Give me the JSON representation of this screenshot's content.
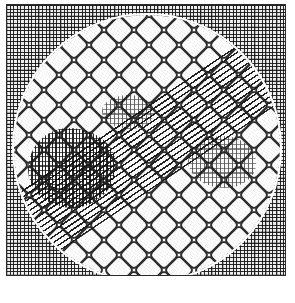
{
  "figure": {
    "kind": "raster-pattern-figure",
    "canvas": {
      "width": 295,
      "height": 303,
      "background": "#ffffff"
    },
    "margins": {
      "top": 4,
      "right": 9,
      "bottom": 27,
      "left": 6
    },
    "frame": {
      "name": "outer plate frame",
      "x": 6,
      "y": 4,
      "width": 280,
      "height": 272,
      "stroke_color": "#2b2b2b",
      "stroke_width": 1.5
    },
    "corner_field": {
      "name": "fine cross-hatch plaid",
      "pitch_px": 3.6,
      "accent_pitch_px": 10.8,
      "ink_color": "#191919",
      "paper_color": "#f2f2f2",
      "description": "dense woven plaid filling the four corners outside the disc"
    },
    "disc": {
      "name": "central circular region",
      "center_x": 147,
      "center_y": 148,
      "radius": 133,
      "halo_width": 2,
      "halo_color": "#ffffff",
      "fill_color": "#ffffff"
    },
    "lattice": {
      "name": "rounded diamond lattice",
      "pitch_px": 30,
      "cell_side_px": 21,
      "corner_radius_px": 5,
      "rotation_deg": 45,
      "stroke_color": "#3a3a3a",
      "stroke_width": 2.1,
      "description": "grid of rounded squares rotated 45 degrees filling the disc"
    },
    "diagonal_band": {
      "name": "horizontally hatched diagonal band",
      "angle_deg": -34,
      "thickness_px": 74,
      "hatch_pitch_px": 5,
      "hatch_line_px": 1.5,
      "ink_color": "#141414",
      "direction": "lower-left to upper-right"
    },
    "dark_blobs": [
      {
        "name": "primary dense blob",
        "cx": 72,
        "cy": 168,
        "rx": 44,
        "ry": 40,
        "density": "high"
      },
      {
        "name": "secondary dense blob",
        "cx": 222,
        "cy": 162,
        "rx": 34,
        "ry": 26,
        "density": "medium"
      },
      {
        "name": "tertiary dense blob",
        "cx": 128,
        "cy": 112,
        "rx": 26,
        "ry": 17,
        "density": "medium"
      }
    ],
    "grain": {
      "name": "scan dither grain",
      "opacity": 0.5,
      "angles_deg": [
        37,
        118
      ]
    },
    "palette": {
      "ink": "#191919",
      "mid_ink": "#3a3a3a",
      "paper": "#ffffff",
      "corner_paper": "#f2f2f2",
      "frame": "#2b2b2b"
    },
    "caption": ""
  }
}
